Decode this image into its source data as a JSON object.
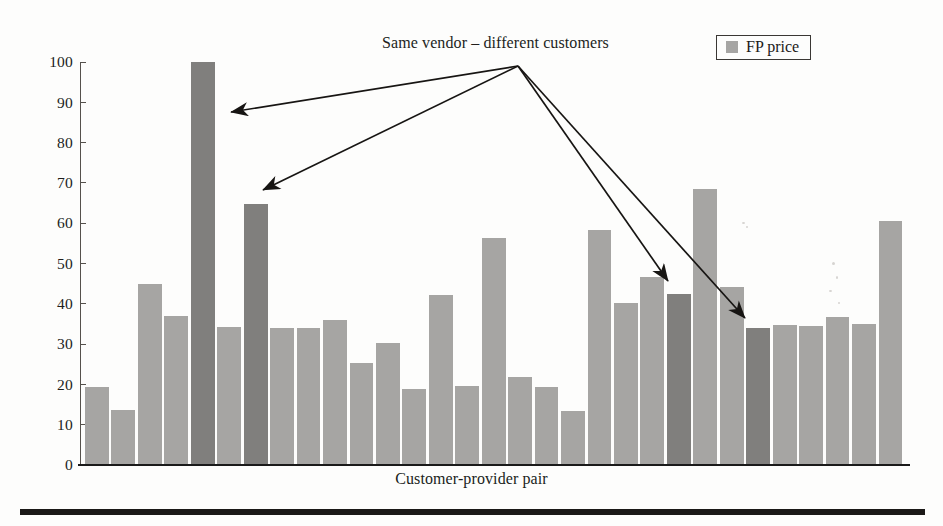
{
  "figure": {
    "background_color": "#fdfdfc",
    "bar_color": "#a6a5a3",
    "highlight_bar_color": "#807f7d",
    "axis_color": "#55514c",
    "text_color": "#201d1b"
  },
  "legend": {
    "position": "top-right",
    "entries": [
      {
        "label": "FP price",
        "color": "#a6a5a3",
        "marker": "square-swatch-icon"
      }
    ]
  },
  "annotation": {
    "text": "Same vendor – different customers",
    "origin": {
      "x": 518,
      "y": 66
    },
    "targets": [
      {
        "x": 231,
        "y": 112,
        "describes_bar_index": 4
      },
      {
        "x": 263,
        "y": 190,
        "describes_bar_index": 6
      },
      {
        "x": 668,
        "y": 281,
        "describes_bar_index": 25
      },
      {
        "x": 745,
        "y": 318,
        "describes_bar_index": 28
      }
    ]
  },
  "chart_data": {
    "type": "bar",
    "title": "",
    "subtitle": "",
    "xlabel": "Customer-provider pair",
    "ylabel": "",
    "ylim": [
      0,
      100
    ],
    "yticks": [
      0,
      10,
      20,
      30,
      40,
      50,
      60,
      70,
      80,
      90,
      100
    ],
    "xticks": [],
    "grid": false,
    "legend_position": "top-right",
    "series": [
      {
        "name": "FP price",
        "color": "#a6a5a3",
        "values": [
          19.4,
          13.6,
          44.8,
          37.0,
          100.0,
          34.2,
          64.8,
          34.0,
          34.0,
          36.0,
          25.2,
          30.2,
          18.8,
          42.2,
          19.7,
          56.3,
          21.9,
          19.4,
          13.3,
          58.4,
          40.2,
          46.6,
          42.5,
          68.5,
          44.2,
          33.9,
          34.7,
          34.6,
          36.8,
          35.1,
          60.6
        ]
      }
    ],
    "highlighted_indices": [
      4,
      6,
      22,
      25
    ]
  }
}
